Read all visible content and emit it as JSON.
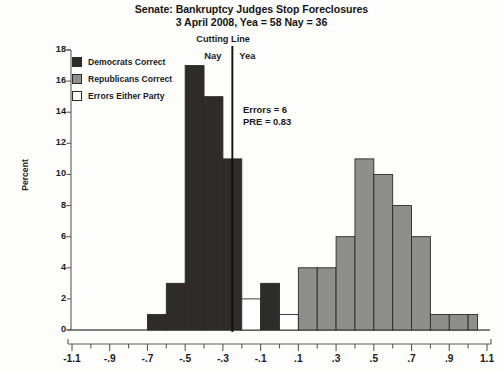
{
  "title": {
    "line1": "Senate: Bankruptcy Judges Stop Foreclosures",
    "line2": "3 April 2008, Yea = 58  Nay = 36"
  },
  "legend": {
    "items": [
      {
        "label": "Democrats Correct",
        "color": "#2e2b28",
        "swatch": "filled-dark"
      },
      {
        "label": "Republicans Correct",
        "color": "#8e8e8a",
        "swatch": "filled-gray"
      },
      {
        "label": "Errors Either Party",
        "color": "#ffffff",
        "swatch": "empty-white"
      }
    ]
  },
  "annotations": {
    "cutting_line_label": "Cutting Line",
    "nay_label": "Nay",
    "yea_label": "Yea",
    "errors_label": "Errors = 6",
    "pre_label": "PRE = 0.83"
  },
  "colors": {
    "democrat": "#2e2b28",
    "republican": "#8e8e8a",
    "error": "#ffffff",
    "axis": "#5a5a56",
    "cutline": "#111111",
    "text": "#1b1b1b",
    "background": "#fdfdfb"
  },
  "chart_data": {
    "type": "bar",
    "subtype": "histogram",
    "title": "Senate: Bankruptcy Judges Stop Foreclosures",
    "subtitle": "3 April 2008, Yea = 58  Nay = 36",
    "xlabel": "",
    "ylabel": "Percent",
    "xlim": [
      -1.1,
      1.1
    ],
    "ylim": [
      0,
      18
    ],
    "bin_width": 0.1,
    "xticks": [
      -1.1,
      -0.9,
      -0.7,
      -0.5,
      -0.3,
      -0.1,
      0.1,
      0.3,
      0.5,
      0.7,
      0.9,
      1.1
    ],
    "xtick_labels": [
      "-1.1",
      "-.9",
      "-.7",
      "-.5",
      "-.3",
      "-.1",
      ".1",
      ".3",
      ".5",
      ".7",
      ".9",
      "1.1"
    ],
    "yticks": [
      0,
      2,
      4,
      6,
      8,
      10,
      12,
      14,
      16,
      18
    ],
    "ytick_labels": [
      "0",
      "2",
      "4",
      "6",
      "8",
      "10",
      "12",
      "14",
      "16",
      "18"
    ],
    "minor_xtick_step": 0.1,
    "grid": false,
    "legend_position": "upper-left",
    "cutting_line_x": -0.25,
    "annotations": {
      "errors": 6,
      "pre": 0.83
    },
    "bins": [
      {
        "x0": -0.7,
        "x1": -0.6,
        "value": 1,
        "group": "democrat"
      },
      {
        "x0": -0.6,
        "x1": -0.5,
        "value": 3,
        "group": "democrat"
      },
      {
        "x0": -0.5,
        "x1": -0.4,
        "value": 17,
        "group": "democrat"
      },
      {
        "x0": -0.4,
        "x1": -0.3,
        "value": 15,
        "group": "democrat"
      },
      {
        "x0": -0.3,
        "x1": -0.25,
        "value": 11,
        "group": "democrat"
      },
      {
        "x0": -0.25,
        "x1": -0.2,
        "value": 11,
        "group": "democrat"
      },
      {
        "x0": -0.2,
        "x1": -0.1,
        "value": 2,
        "group": "error"
      },
      {
        "x0": -0.1,
        "x1": 0.0,
        "value": 3,
        "group": "democrat"
      },
      {
        "x0": 0.0,
        "x1": 0.1,
        "value": 1,
        "group": "error"
      },
      {
        "x0": 0.1,
        "x1": 0.2,
        "value": 4,
        "group": "republican"
      },
      {
        "x0": 0.2,
        "x1": 0.3,
        "value": 4,
        "group": "republican"
      },
      {
        "x0": 0.3,
        "x1": 0.4,
        "value": 6,
        "group": "republican"
      },
      {
        "x0": 0.4,
        "x1": 0.5,
        "value": 11,
        "group": "republican"
      },
      {
        "x0": 0.5,
        "x1": 0.6,
        "value": 10,
        "group": "republican"
      },
      {
        "x0": 0.6,
        "x1": 0.7,
        "value": 8,
        "group": "republican"
      },
      {
        "x0": 0.7,
        "x1": 0.8,
        "value": 6,
        "group": "republican"
      },
      {
        "x0": 0.8,
        "x1": 0.9,
        "value": 1,
        "group": "republican"
      },
      {
        "x0": 0.9,
        "x1": 1.0,
        "value": 1,
        "group": "republican"
      },
      {
        "x0": 1.0,
        "x1": 1.05,
        "value": 1,
        "group": "republican"
      }
    ]
  }
}
